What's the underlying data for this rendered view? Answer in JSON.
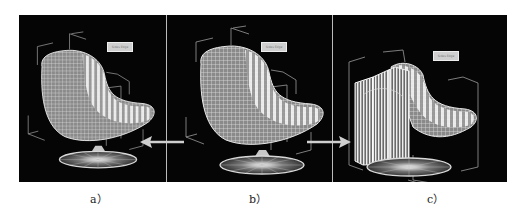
{
  "figure": {
    "panels": [
      {
        "id": "a",
        "caption": "a）",
        "tag": "Sides Edge",
        "model": "egg-chair-wireframe"
      },
      {
        "id": "b",
        "caption": "b）",
        "tag": "Sides Edge",
        "model": "egg-chair-wireframe"
      },
      {
        "id": "c",
        "caption": "c）",
        "tag": "Sides Edge",
        "model": "egg-chair-wireframe-extruded"
      }
    ],
    "arrows": [
      {
        "from": "b",
        "to": "a",
        "direction": "left"
      },
      {
        "from": "b",
        "to": "c",
        "direction": "right"
      }
    ],
    "colors": {
      "background": "#050505",
      "wire": "#d8d8d8",
      "highlight": "#ffffff",
      "bbox": "#9a9a9a"
    }
  }
}
